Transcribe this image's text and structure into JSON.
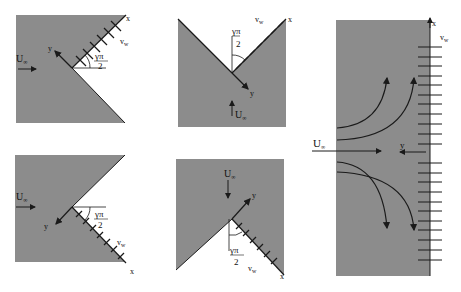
{
  "colors": {
    "fill": "#8c8c8c",
    "line": "#1a1a1a",
    "background": "#ffffff"
  },
  "panels": [
    {
      "id": "top-left",
      "labels": {
        "U": "U",
        "U_sub": "∞",
        "x": "x",
        "y": "y",
        "v": "v",
        "v_sub": "w",
        "angle_num": "γπ",
        "angle_den": "2"
      }
    },
    {
      "id": "top-middle",
      "labels": {
        "U": "U",
        "U_sub": "∞",
        "x": "x",
        "y": "y",
        "v": "v",
        "v_sub": "w",
        "angle_num": "γπ",
        "angle_den": "2"
      }
    },
    {
      "id": "bottom-left",
      "labels": {
        "U": "U",
        "U_sub": "∞",
        "x": "x",
        "y": "y",
        "v": "v",
        "v_sub": "w",
        "angle_num": "γπ",
        "angle_den": "2"
      }
    },
    {
      "id": "bottom-middle",
      "labels": {
        "U": "U",
        "U_sub": "∞",
        "x": "x",
        "y": "y",
        "v": "v",
        "v_sub": "w",
        "angle_num": "γπ",
        "angle_den": "2"
      }
    },
    {
      "id": "right",
      "labels": {
        "U": "U",
        "U_sub": "∞",
        "x": "x",
        "y": "y",
        "v": "v",
        "v_sub": "w"
      }
    }
  ]
}
